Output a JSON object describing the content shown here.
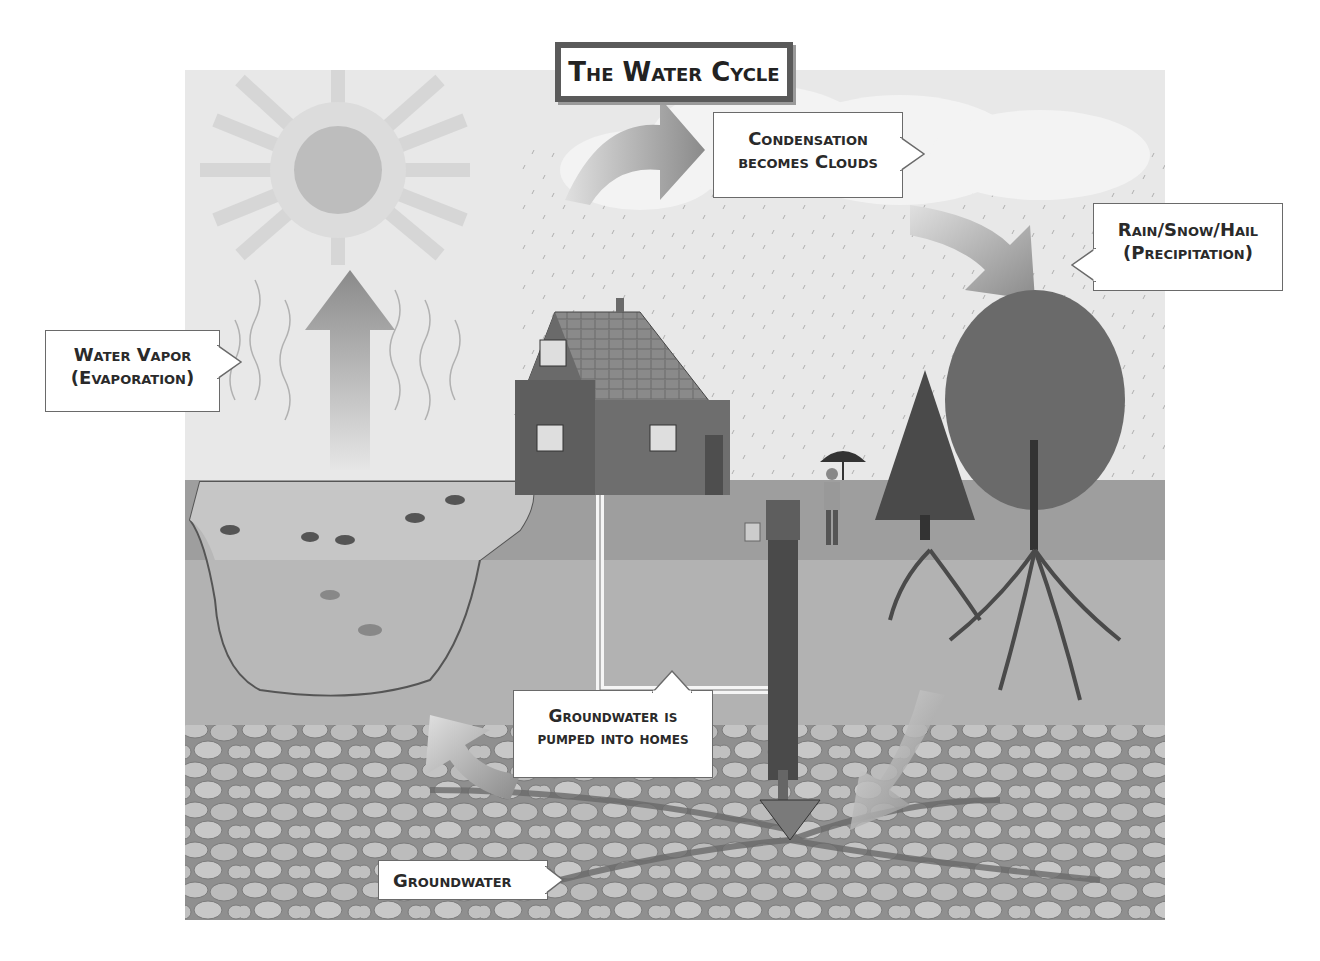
{
  "title": "The Water Cycle",
  "labels": {
    "condensation": {
      "line1": "Condensation",
      "line2": "becomes Clouds"
    },
    "precipitation": {
      "line1": "Rain/Snow/Hail",
      "line2": "(Precipitation)"
    },
    "evaporation": {
      "line1": "Water Vapor",
      "line2": "(Evaporation)"
    },
    "pumped": {
      "line1": "Groundwater is",
      "line2": "pumped into homes"
    },
    "groundwater": {
      "line1": "Groundwater"
    }
  },
  "colors": {
    "sky": "#e6e6e6",
    "ground": "#9c9c9c",
    "soil": "#b0b0b0",
    "rock": "#bdbdbd",
    "arrow": "#8a8a8a",
    "sun": "#bcbcbc"
  }
}
